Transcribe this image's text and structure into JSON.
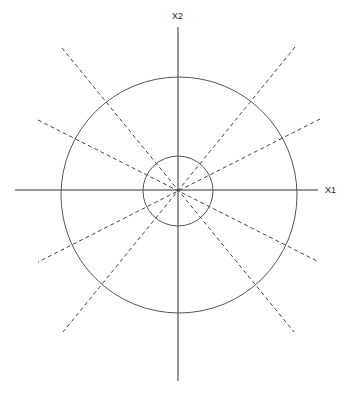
{
  "diagram": {
    "axes": {
      "x_label": "X1",
      "y_label": "X2"
    },
    "circles": [
      {
        "name": "inner",
        "cx": 178,
        "cy": 190,
        "r": 35
      },
      {
        "name": "outer",
        "cx": 179,
        "cy": 195,
        "r": 118
      }
    ],
    "dashed_rays": 8,
    "colors": {
      "line": "#333333",
      "circle": "#555555",
      "dash": "#444444"
    }
  }
}
